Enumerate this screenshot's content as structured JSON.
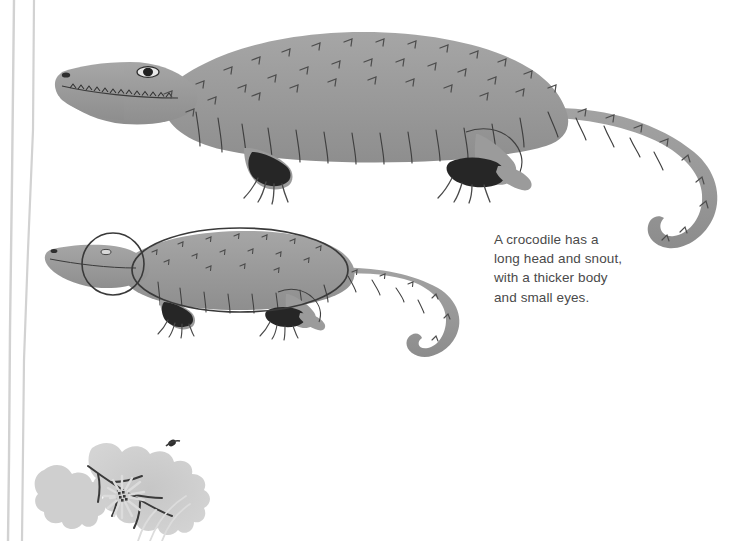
{
  "page": {
    "background_color": "#ffffff",
    "kind": "illustration-with-caption"
  },
  "caption": {
    "text": "A crocodile has a\nlong head and snout,\nwith a thicker body\nand small eyes.",
    "color": "#4a4a4a"
  },
  "palette": {
    "body_grey": "#9b9b9b",
    "body_grey_light": "#ababab",
    "body_grey_dark": "#8a8a8a",
    "outline_dark": "#3a3a3a",
    "claw_black": "#2b2b2b",
    "leaf_grey": "#c9c9c9",
    "stem_grey": "#d2d2d2",
    "flower_grey": "#d8d8d8",
    "flower_center": "#3a3a3a",
    "annotation_line": "#4a4a4a"
  },
  "figures": {
    "crocodile_full": {
      "label": "crocodile-full-body",
      "description": "large grey crocodile in side view facing left, long snout with teeth, scaled back, four clawed feet, long curving tail"
    },
    "crocodile_annotated": {
      "label": "crocodile-annotated-proportions",
      "description": "smaller grey crocodile overlaid with a circle around the head and an ellipse around the body showing proportions"
    },
    "annotation_head_circle": {
      "label": "head-proportion-circle"
    },
    "annotation_body_ellipse": {
      "label": "body-proportion-ellipse"
    },
    "leaf": {
      "label": "oak-leaf-decoration"
    },
    "flower": {
      "label": "daisy-flower-decoration"
    },
    "stems": {
      "label": "plant-stems-decoration"
    }
  }
}
